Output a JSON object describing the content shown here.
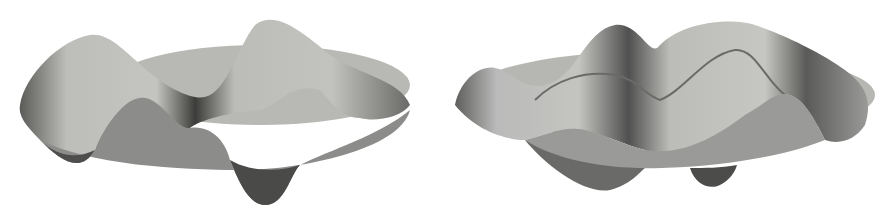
{
  "figure": {
    "panels": [
      {
        "id": "left",
        "description": "3D surface rendering of a vibrating circular membrane mode with four lobes"
      },
      {
        "id": "right",
        "description": "3D surface rendering of a vibrating circular membrane mode with multiple ridges"
      }
    ],
    "colors": {
      "background": "#ffffff",
      "surface_light": "#c8c8c4",
      "surface_mid": "#9a9a96",
      "surface_dark": "#3e3e3c",
      "disc": "#b4b4b0"
    }
  }
}
